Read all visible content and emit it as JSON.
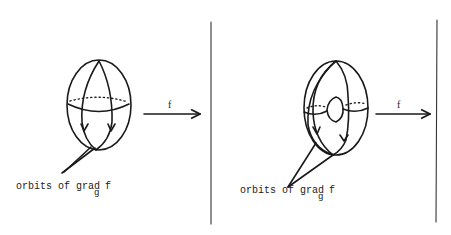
{
  "panels": [
    {
      "name": "sphere",
      "arrow_label": "f",
      "caption_main": "orbits of grad",
      "caption_subscript": "g",
      "caption_tail": "f"
    },
    {
      "name": "torus",
      "arrow_label": "f",
      "caption_main": "orbits of grad",
      "caption_subscript": "g",
      "caption_tail": "f"
    }
  ]
}
